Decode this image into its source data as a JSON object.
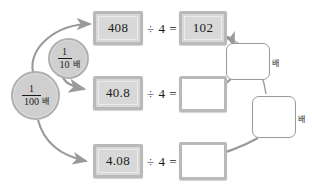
{
  "worksheet": {
    "title": "Decimal division relation diagram",
    "colors": {
      "box_fill": "#d8d8d8",
      "box_border": "#b9b9b9",
      "circle_fill": "#cfcfcf",
      "circle_border": "#b0b0b0",
      "arrow": "#9a9a9a",
      "text": "#1b1b1b",
      "page_background": "#ffffff"
    },
    "rows": [
      {
        "id": "row-1",
        "dividend": "408",
        "operator": "÷ 4 =",
        "quotient": "102",
        "quotient_filled": true
      },
      {
        "id": "row-2",
        "dividend": "40.8",
        "operator": "÷ 4 =",
        "quotient": "",
        "quotient_filled": false
      },
      {
        "id": "row-3",
        "dividend": "4.08",
        "operator": "÷ 4 =",
        "quotient": "",
        "quotient_filled": false
      }
    ],
    "multiplier_circles": [
      {
        "id": "circle-one-tenth",
        "numerator": "1",
        "denominator": "10",
        "suffix": "배"
      },
      {
        "id": "circle-one-hundredth",
        "numerator": "1",
        "denominator": "100",
        "suffix": "배"
      }
    ],
    "answer_slots": [
      {
        "id": "slot-upper",
        "value": "",
        "suffix": "배"
      },
      {
        "id": "slot-lower",
        "value": "",
        "suffix": "배"
      }
    ]
  }
}
